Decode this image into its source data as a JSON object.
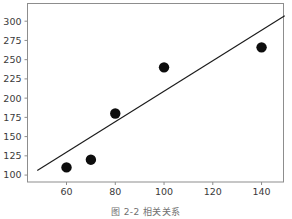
{
  "figure": {
    "caption_prefix": "图",
    "caption_number": "2-2",
    "caption_title": "相关关系",
    "background_color": "#ffffff",
    "frame_color": "#8d8d8d",
    "point_color": "#0d0d0d",
    "line_color": "#1a1a1a",
    "tick_label_color": "#3a3a3a",
    "caption_color": "#6f6f6f"
  },
  "chart_data": {
    "type": "scatter",
    "title": "",
    "subtitle": "",
    "xlabel": "",
    "ylabel": "",
    "xlim": [
      44,
      149
    ],
    "ylim": [
      91,
      323
    ],
    "grid": false,
    "legend": false,
    "legend_position": "none",
    "xticks": [
      60,
      80,
      100,
      120,
      140
    ],
    "xtick_labels": [
      "60",
      "80",
      "100",
      "120",
      "140"
    ],
    "yticks": [
      100,
      125,
      150,
      175,
      200,
      225,
      250,
      275,
      300
    ],
    "ytick_labels": [
      "100",
      "125",
      "150",
      "175",
      "200",
      "225",
      "250",
      "275",
      "300"
    ],
    "x": [
      60,
      70,
      80,
      100,
      140
    ],
    "y": [
      110,
      120,
      180,
      240,
      266
    ],
    "points": [
      {
        "x": 60,
        "y": 110
      },
      {
        "x": 70,
        "y": 120
      },
      {
        "x": 80,
        "y": 180
      },
      {
        "x": 100,
        "y": 240
      },
      {
        "x": 140,
        "y": 266
      }
    ],
    "marker": "circle",
    "marker_size_px": 5.2,
    "series": [
      {
        "name": "observations",
        "type": "scatter",
        "x": [
          60,
          70,
          80,
          100,
          140
        ],
        "values": [
          110,
          120,
          180,
          240,
          266
        ]
      },
      {
        "name": "trend-line",
        "type": "line",
        "x": [
          48,
          149.5
        ],
        "values": [
          106,
          307
        ]
      }
    ],
    "annotations": []
  }
}
